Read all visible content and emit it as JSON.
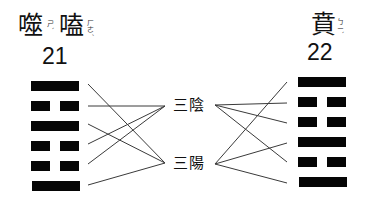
{
  "left_hexagram": {
    "name_chars": [
      "噬",
      "嗑"
    ],
    "zhuyin": [
      "ㄕˋ",
      "ㄏㄜˊ"
    ],
    "number": "21",
    "lines_top_to_bottom": [
      "yang",
      "yin",
      "yang",
      "yin",
      "yin",
      "yang"
    ]
  },
  "right_hexagram": {
    "name_chars": [
      "賁"
    ],
    "zhuyin": [
      "ㄅㄧˋ"
    ],
    "number": "22",
    "lines_top_to_bottom": [
      "yang",
      "yin",
      "yin",
      "yang",
      "yin",
      "yang"
    ]
  },
  "center_labels": {
    "yin_group": "三陰",
    "yang_group": "三陽"
  },
  "connections": {
    "left": [
      "三陽",
      "三陰",
      "三陽",
      "三陰",
      "三陰",
      "三陽"
    ],
    "right": [
      "三陽",
      "三陰",
      "三陰",
      "三陽",
      "三陰",
      "三陽"
    ]
  },
  "colors": {
    "bar": "#050505",
    "connector": "#3a3a3a",
    "background": "#ffffff"
  }
}
